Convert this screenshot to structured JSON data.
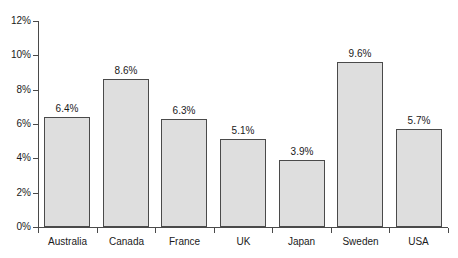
{
  "chart_data": {
    "type": "bar",
    "title": "",
    "subtitle": "",
    "xlabel": "",
    "ylabel": "",
    "categories": [
      "Australia",
      "Canada",
      "France",
      "UK",
      "Japan",
      "Sweden",
      "USA"
    ],
    "values": [
      6.4,
      8.6,
      6.3,
      5.1,
      3.9,
      9.6,
      5.7
    ],
    "data_labels": [
      "6.4%",
      "8.6%",
      "6.3%",
      "5.1%",
      "3.9%",
      "9.6%",
      "5.7%"
    ],
    "ylim": [
      0,
      12
    ],
    "ytick_values": [
      0,
      2,
      4,
      6,
      8,
      10,
      12
    ],
    "ytick_labels": [
      "0%",
      "2%",
      "4%",
      "6%",
      "8%",
      "10%",
      "12%"
    ],
    "grid": false,
    "legend": null,
    "legend_position": "none",
    "bar_fill_color": "#dedede",
    "bar_edge_color": "#4a4a4a",
    "axis_color": "#4a4a4a",
    "background_color": "#ffffff",
    "text_color": "#1a1a1a"
  }
}
